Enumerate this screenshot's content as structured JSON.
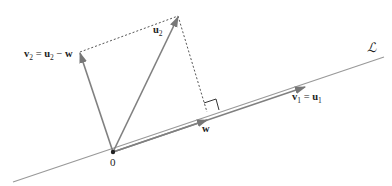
{
  "diagram": {
    "title_clipped": "",
    "line_label": "ℒ",
    "origin_label": "0",
    "labels": {
      "v2": {
        "main": "v",
        "sub": "2",
        "eq": " = ",
        "rhs_main": "u",
        "rhs_sub": "2",
        "minus": " − ",
        "rhs_w": "w"
      },
      "u2": {
        "main": "u",
        "sub": "2"
      },
      "w": {
        "main": "w"
      },
      "v1": {
        "main": "v",
        "sub": "1",
        "eq": " = ",
        "rhs_main": "u",
        "rhs_sub": "1"
      }
    },
    "colors": {
      "vector": "#808080",
      "line": "#999999",
      "dashed": "#555555",
      "text": "#222222"
    },
    "points": {
      "origin": [
        113,
        152
      ],
      "u2_tip": [
        178,
        16
      ],
      "v2_tip": [
        80,
        52
      ],
      "w_tip": [
        207,
        116
      ],
      "v1_tip": [
        305,
        82
      ],
      "line_start": [
        13,
        182
      ],
      "line_end": [
        384,
        57
      ]
    }
  }
}
